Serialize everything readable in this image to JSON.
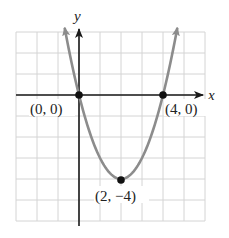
{
  "chart_data": {
    "type": "line",
    "title": "",
    "function": "y = x^2 - 4x",
    "xlabel": "x",
    "ylabel": "y",
    "xlim": [
      -3,
      6
    ],
    "ylim": [
      -6,
      3
    ],
    "grid": true,
    "grid_step": 1,
    "series": [
      {
        "name": "parabola",
        "x": [
          -0.65,
          0,
          1,
          2,
          3,
          4,
          4.65
        ],
        "y": [
          3,
          0,
          -3,
          -4,
          -3,
          0,
          3
        ]
      }
    ],
    "points": [
      {
        "x": 0,
        "y": 0,
        "label": "(0, 0)"
      },
      {
        "x": 4,
        "y": 0,
        "label": "(4, 0)"
      },
      {
        "x": 2,
        "y": -4,
        "label": "(2, −4)"
      }
    ]
  },
  "colors": {
    "grid": "#d4d4d4",
    "axis": "#1a1a1a",
    "curve": "#8c8c8c",
    "point": "#111111"
  }
}
